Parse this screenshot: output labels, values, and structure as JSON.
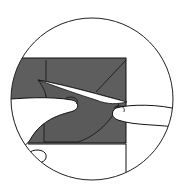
{
  "illustration": {
    "subject": "hands peeling back a folded paper flap",
    "colors": {
      "background": "#ffffff",
      "paper_dark": "#5e5e5e",
      "paper_light": "#ffffff",
      "line": "#111111"
    }
  }
}
